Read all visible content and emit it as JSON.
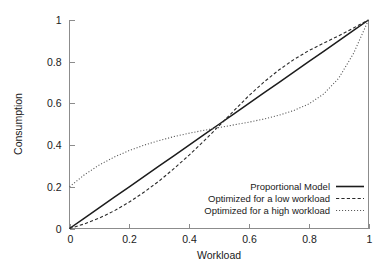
{
  "chart_data": {
    "type": "line",
    "title": "",
    "xlabel": "Workload",
    "ylabel": "Consumption",
    "xlim": [
      0,
      1
    ],
    "ylim": [
      0,
      1
    ],
    "grid": false,
    "legend_position": "bottom-right",
    "xticks": [
      "0",
      "0.2",
      "0.4",
      "0.6",
      "0.8",
      "1"
    ],
    "xtick_values": [
      0,
      0.2,
      0.4,
      0.6,
      0.8,
      1
    ],
    "yticks": [
      "0",
      "0.2",
      "0.4",
      "0.6",
      "0.8",
      "1"
    ],
    "ytick_values": [
      0,
      0.2,
      0.4,
      0.6,
      0.8,
      1
    ],
    "x": [
      0,
      0.05,
      0.1,
      0.15,
      0.2,
      0.25,
      0.3,
      0.35,
      0.4,
      0.45,
      0.5,
      0.55,
      0.6,
      0.65,
      0.7,
      0.75,
      0.8,
      0.85,
      0.9,
      0.95,
      1
    ],
    "series": [
      {
        "name": "Proportional Model",
        "style": "solid",
        "color": "#1c1c1c",
        "values": [
          0,
          0.05,
          0.1,
          0.15,
          0.2,
          0.25,
          0.3,
          0.35,
          0.4,
          0.45,
          0.5,
          0.55,
          0.6,
          0.65,
          0.7,
          0.75,
          0.8,
          0.85,
          0.9,
          0.95,
          1
        ]
      },
      {
        "name": "Optimized for a low workload",
        "style": "dashed",
        "color": "#2a2a2a",
        "values": [
          0,
          0.022,
          0.05,
          0.085,
          0.127,
          0.175,
          0.228,
          0.288,
          0.352,
          0.42,
          0.492,
          0.565,
          0.637,
          0.702,
          0.76,
          0.81,
          0.853,
          0.889,
          0.924,
          0.962,
          1
        ]
      },
      {
        "name": "Optimized for a high workload",
        "style": "dotted",
        "color": "#5a5a5a",
        "values": [
          0.2,
          0.258,
          0.305,
          0.343,
          0.374,
          0.4,
          0.422,
          0.441,
          0.457,
          0.471,
          0.484,
          0.497,
          0.51,
          0.525,
          0.543,
          0.566,
          0.597,
          0.645,
          0.72,
          0.84,
          1
        ]
      }
    ]
  },
  "legend": {
    "entries": [
      {
        "label": "Proportional Model"
      },
      {
        "label": "Optimized for a low workload"
      },
      {
        "label": "Optimized for a high workload"
      }
    ]
  },
  "axes": {
    "x_title": "Workload",
    "y_title": "Consumption"
  }
}
